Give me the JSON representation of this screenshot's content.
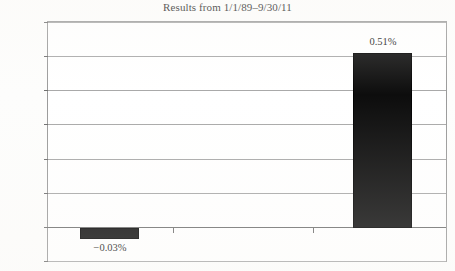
{
  "chart_data": {
    "type": "bar",
    "title": "Results from 1/1/89–9/30/11",
    "xlabel": "",
    "ylabel": "",
    "categories": [
      "",
      "",
      ""
    ],
    "values": [
      -0.03,
      null,
      0.51
    ],
    "data_labels": [
      "−0.03%",
      "",
      "0.51%"
    ],
    "ylim": [
      -0.1,
      0.6
    ],
    "ytick_values": [
      0.6,
      0.5,
      0.4,
      0.3,
      0.2,
      0.1,
      0.0,
      -0.1
    ],
    "ytick_labels": [
      "0.60%",
      "0.50%",
      "0.40%",
      "0.30%",
      "0.20%",
      "0.10%",
      "0.00%",
      "-0.10%"
    ],
    "grid": true,
    "legend": false,
    "series": [
      {
        "name": "Results",
        "values": [
          -0.03,
          null,
          0.51
        ]
      }
    ],
    "colors": {
      "bar_fill": "#0d0d0d",
      "gridline": "#a8a8a8",
      "zero_line": "#6e6e6e",
      "frame": "#9a9a9a",
      "text": "#1a1a1a",
      "background": "#ffffff"
    }
  }
}
